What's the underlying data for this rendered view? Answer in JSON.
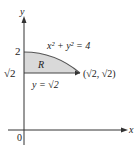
{
  "diagram": {
    "axes": {
      "x_label": "x",
      "y_label": "y",
      "origin_label": "0"
    },
    "ticks": {
      "y_two": "2",
      "y_sqrt2": "√2"
    },
    "region": {
      "label": "R",
      "fill_color": "#d9d9d9",
      "stroke_color": "#555555"
    },
    "labels": {
      "circle_equation": "x² + y² = 4",
      "line_equation": "y = √2",
      "point": "(√2, √2)"
    }
  }
}
